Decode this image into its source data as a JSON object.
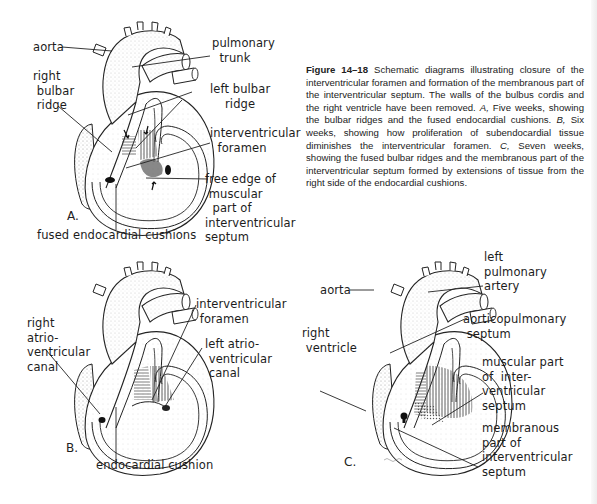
{
  "caption": {
    "figure_number": "Figure 14–18",
    "text_1": " Schematic diagrams illustrating closure of the interventricular foramen and formation of the membranous part of the interventricular septum. The walls of the bulbus cordis and the right ventricle have been removed. ",
    "a_marker": "A,",
    "text_a": " Five weeks, showing the bulbar ridges and the fused endocardial cushions. ",
    "b_marker": "B,",
    "text_b": " Six weeks, showing how proliferation of subendocardial tissue diminishes the interventricular foramen. ",
    "c_marker": "C,",
    "text_c": " Seven weeks, showing the fused bulbar ridges and the membranous part of the interventricular septum formed by extensions of tissue from the right side of the endocardial cushions."
  },
  "panel_a": {
    "letter": "A.",
    "labels": {
      "aorta": "aorta",
      "pulmonary_trunk": "pulmonary\n  trunk",
      "right_bulbar_ridge": "right\n bulbar\n ridge",
      "left_bulbar_ridge": "left bulbar\n    ridge",
      "interventricular_foramen": "interventricular\n  foramen",
      "free_edge": "free edge of\n muscular\n  part of\ninterventricular\nseptum",
      "fused_endocardial_cushions": "fused endocardial cushions"
    }
  },
  "panel_b": {
    "letter": "B.",
    "labels": {
      "right_av_canal": "right\natrio-\nventricular\ncanal",
      "interventricular_foramen": "interventricular\n foramen",
      "left_av_canal": "left atrio-\n ventricular\n canal",
      "endocardial_cushion": "endocardial cushion"
    }
  },
  "panel_c": {
    "letter": "C.",
    "labels": {
      "aorta": "aorta",
      "left_pulmonary_artery": "left\npulmonary\nartery",
      "aorticopulmonary_septum": "aorticopulmonary\n septum",
      "right_ventricle": "right\n ventricle",
      "muscular_part": "muscular part\nof  inter-\nventricular\nseptum",
      "membranous_part": "membranous\npart of\ninterventricular\nseptum"
    }
  },
  "colors": {
    "ink": "#1a1a1a",
    "stipple": "#bdbdbd",
    "paper": "#ffffff"
  }
}
